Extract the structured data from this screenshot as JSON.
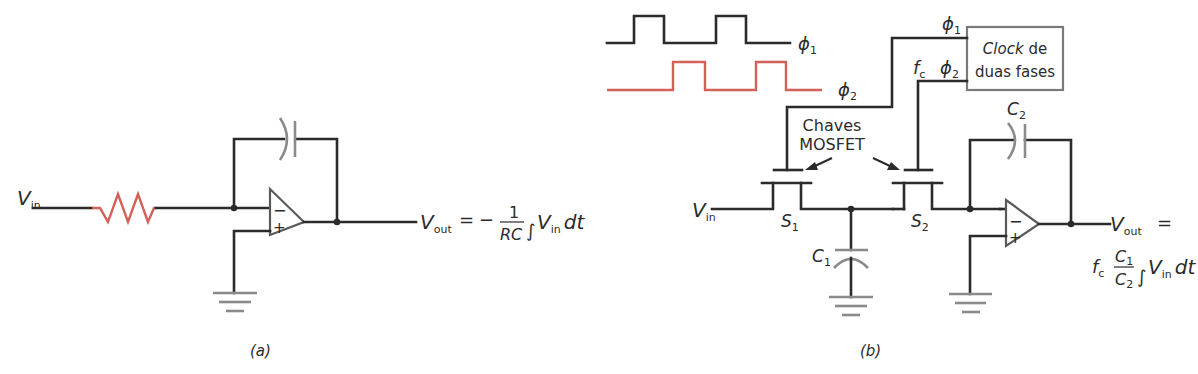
{
  "figure": {
    "panel_a": {
      "caption": "(a)",
      "input_label": "V",
      "input_sub": "in",
      "output_label": "V",
      "output_sub": "out",
      "equation": {
        "equals": "=",
        "minus": "−",
        "numerator": "1",
        "denominator": "RC",
        "integral": "∫",
        "integrand": "V",
        "integrand_sub": "in",
        "dt": "dt"
      },
      "components": [
        "resistor",
        "capacitor",
        "op-amp",
        "ground"
      ],
      "opamp_minus": "−",
      "opamp_plus": "+"
    },
    "panel_b": {
      "caption": "(b)",
      "clock_phi1": "ϕ",
      "clock_phi1_sub": "1",
      "clock_phi2": "ϕ",
      "clock_phi2_sub": "2",
      "wire_phi1": "ϕ",
      "wire_phi1_sub": "1",
      "wire_phi2": "ϕ",
      "wire_phi2_sub": "2",
      "fc_label": "f",
      "fc_sub": "c",
      "clock_box_line1_italic": "Clock",
      "clock_box_line1_rest": " de",
      "clock_box_line2": "duas fases",
      "switches_line1": "Chaves",
      "switches_line2": "MOSFET",
      "input_label": "V",
      "input_sub": "in",
      "s1": "S",
      "s1_sub": "1",
      "s2": "S",
      "s2_sub": "2",
      "c1": "C",
      "c1_sub": "1",
      "c2": "C",
      "c2_sub": "2",
      "output_label": "V",
      "output_sub": "out",
      "equals": "=",
      "equation": {
        "fc": "f",
        "fc_sub": "c",
        "numerator": "C",
        "numerator_sub": "1",
        "denominator": "C",
        "denominator_sub": "2",
        "integral": "∫",
        "integrand": "V",
        "integrand_sub": "in",
        "dt": "dt"
      },
      "opamp_minus": "−",
      "opamp_plus": "+"
    },
    "colors": {
      "wire": "#2b2b2b",
      "component": "#8a8a8a",
      "accent_red": "#d4605a"
    }
  }
}
